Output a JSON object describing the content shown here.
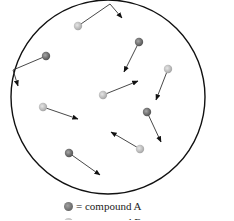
{
  "diagram": {
    "title": "",
    "container": {
      "shape": "circle",
      "cx": 108,
      "cy": 97,
      "r": 97,
      "stroke": "#111111"
    },
    "colors": {
      "compound_A": "#7a7a7a",
      "compound_B": "#c4c4c4",
      "arrow": "#111111"
    },
    "particles": [
      {
        "type": "B",
        "x": 78,
        "y": 26,
        "path": [
          [
            78,
            26
          ],
          [
            110,
            4
          ],
          [
            122,
            18
          ]
        ],
        "bounced": true
      },
      {
        "type": "A",
        "x": 46,
        "y": 56,
        "path": [
          [
            46,
            56
          ],
          [
            13,
            70
          ],
          [
            18,
            86
          ]
        ],
        "bounced": true
      },
      {
        "type": "A",
        "x": 139,
        "y": 42,
        "path": [
          [
            139,
            42
          ],
          [
            124,
            72
          ]
        ],
        "bounced": false
      },
      {
        "type": "B",
        "x": 168,
        "y": 69,
        "path": [
          [
            168,
            69
          ],
          [
            156,
            100
          ]
        ],
        "bounced": false
      },
      {
        "type": "B",
        "x": 103,
        "y": 95,
        "path": [
          [
            103,
            95
          ],
          [
            138,
            81
          ]
        ],
        "bounced": false
      },
      {
        "type": "B",
        "x": 43,
        "y": 107,
        "path": [
          [
            43,
            107
          ],
          [
            78,
            119
          ]
        ],
        "bounced": false
      },
      {
        "type": "A",
        "x": 147,
        "y": 112,
        "path": [
          [
            147,
            112
          ],
          [
            161,
            142
          ]
        ],
        "bounced": false
      },
      {
        "type": "B",
        "x": 140,
        "y": 149,
        "path": [
          [
            140,
            149
          ],
          [
            111,
            132
          ]
        ],
        "bounced": false
      },
      {
        "type": "A",
        "x": 69,
        "y": 153,
        "path": [
          [
            69,
            153
          ],
          [
            100,
            175
          ]
        ],
        "bounced": false
      }
    ]
  },
  "legend": {
    "items": [
      {
        "symbol": "dark",
        "label": "= compound A"
      },
      {
        "symbol": "light",
        "label": "= compound B"
      }
    ]
  }
}
